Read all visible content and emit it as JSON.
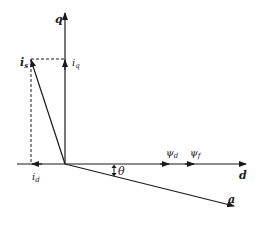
{
  "diagram": {
    "type": "dq-phasor-diagram",
    "colors": {
      "line": "#1a1a1a",
      "background": "#ffffff"
    },
    "axes": {
      "q": {
        "label": "q"
      },
      "d": {
        "label": "d"
      },
      "a": {
        "label": "a"
      }
    },
    "vectors": {
      "is": {
        "label": "i",
        "sub": "s"
      },
      "iq": {
        "label": "i",
        "sub": "q"
      },
      "id": {
        "label": "i",
        "sub": "d"
      },
      "psi_d": {
        "label": "ψ",
        "sub": "d"
      },
      "psi_f": {
        "label": "ψ",
        "sub": "f"
      }
    },
    "angle": {
      "label": "θ"
    }
  }
}
